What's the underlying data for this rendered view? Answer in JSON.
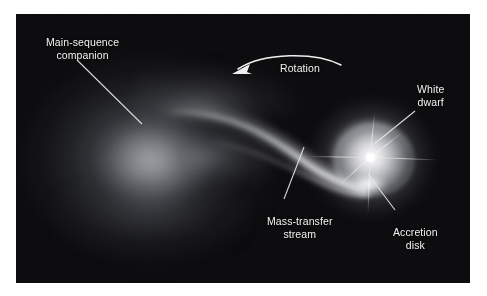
{
  "figure": {
    "frame": {
      "x": 16,
      "y": 14,
      "width": 454,
      "height": 269,
      "background_color": "#0a0a0c"
    },
    "label_color": "#f2f2f0",
    "leader_line_color": "#e8e8e6"
  },
  "labels": {
    "companion": "Main-sequence\ncompanion",
    "rotation": "Rotation",
    "white_dwarf": "White\ndwarf",
    "mass_transfer_stream": "Mass-transfer\nstream",
    "accretion_disk": "Accretion\ndisk"
  },
  "objects": [
    {
      "name": "main-sequence-companion",
      "description": "large diffuse teardrop-shaped glowing star on the left",
      "center": [
        120,
        145
      ]
    },
    {
      "name": "mass-transfer-stream",
      "description": "luminous stream arcing from companion to the disk",
      "center": [
        270,
        150
      ]
    },
    {
      "name": "accretion-disk",
      "description": "bright rotating disk of gas encircling the white dwarf",
      "center": [
        355,
        143
      ]
    },
    {
      "name": "white-dwarf",
      "description": "brilliant point source at the centre of the accretion disk",
      "center": [
        355,
        143
      ]
    },
    {
      "name": "hot-spot",
      "description": "bright impact point where the stream strikes the disk rim",
      "center": [
        353,
        170
      ]
    }
  ],
  "rotation_arrow": {
    "direction": "counterclockwise",
    "arrowhead": "left"
  }
}
